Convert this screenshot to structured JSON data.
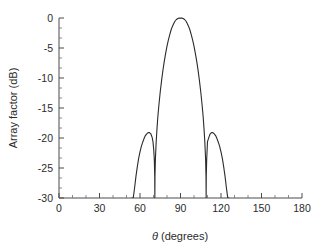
{
  "chart_data": {
    "type": "line",
    "title": "",
    "subtitle": "",
    "xlabel": "θ (degrees)",
    "ylabel": "Array factor (dB)",
    "xlim": [
      0,
      180
    ],
    "ylim": [
      -30,
      0
    ],
    "xticks": [
      0,
      30,
      60,
      90,
      120,
      150,
      180
    ],
    "xticklabels": [
      "0",
      "30",
      "60",
      "90",
      "120",
      "150",
      "180"
    ],
    "yticks": [
      0,
      -5,
      -10,
      -15,
      -20,
      -25,
      -30
    ],
    "yticklabels": [
      "0",
      "-5",
      "-10",
      "-15",
      "-20",
      "-25",
      "-30"
    ],
    "minor_ticks_per_interval": 2,
    "grid": false,
    "legend": null,
    "annotations": [],
    "line_color": "#2b2b2b",
    "axis_color": "#4a4a4a",
    "background_color": "#ffffff",
    "series": [
      {
        "name": "Array factor",
        "x": [
          54.0,
          55.0,
          56.0,
          57.0,
          58.0,
          59.0,
          60.0,
          61.0,
          62.0,
          63.0,
          64.0,
          65.0,
          66.0,
          67.0,
          68.0,
          69.0,
          69.6,
          70.2,
          70.6,
          70.9,
          71.0,
          71.1,
          71.4,
          72.0,
          72.6,
          73.2,
          74.0,
          75.0,
          76.0,
          77.0,
          78.0,
          79.0,
          80.0,
          81.0,
          82.0,
          83.0,
          84.0,
          85.0,
          86.0,
          87.0,
          88.0,
          89.0,
          90.0,
          91.0,
          92.0,
          93.0,
          94.0,
          95.0,
          96.0,
          97.0,
          98.0,
          99.0,
          100.0,
          101.0,
          102.0,
          103.0,
          104.0,
          105.0,
          106.0,
          106.8,
          107.4,
          108.0,
          108.6,
          108.9,
          109.0,
          109.1,
          109.4,
          110.0,
          111.0,
          112.0,
          113.0,
          114.0,
          115.0,
          116.0,
          117.0,
          118.0,
          119.0,
          120.0,
          121.0,
          122.0,
          123.0,
          124.0,
          125.0,
          126.0
        ],
        "y": [
          -30.0,
          -30.0,
          -28.3,
          -26.4,
          -24.8,
          -23.4,
          -22.3,
          -21.4,
          -20.7,
          -20.1,
          -19.6,
          -19.3,
          -19.1,
          -19.1,
          -19.3,
          -19.9,
          -20.6,
          -22.0,
          -23.6,
          -26.5,
          -30.0,
          -26.5,
          -23.6,
          -20.6,
          -18.4,
          -16.5,
          -14.5,
          -12.3,
          -10.4,
          -8.7,
          -7.2,
          -5.9,
          -4.7,
          -3.7,
          -2.8,
          -2.0,
          -1.4,
          -0.9,
          -0.5,
          -0.25,
          -0.08,
          -0.02,
          0.0,
          -0.02,
          -0.08,
          -0.25,
          -0.5,
          -0.9,
          -1.4,
          -2.0,
          -2.8,
          -3.7,
          -4.7,
          -5.9,
          -7.2,
          -8.7,
          -10.4,
          -12.3,
          -14.5,
          -16.5,
          -18.4,
          -20.6,
          -23.6,
          -26.5,
          -30.0,
          -26.5,
          -23.6,
          -20.6,
          -19.9,
          -19.3,
          -19.1,
          -19.1,
          -19.3,
          -19.6,
          -20.1,
          -20.7,
          -21.4,
          -22.3,
          -23.4,
          -24.8,
          -26.4,
          -28.3,
          -30.0,
          -30.0
        ]
      }
    ],
    "features": {
      "main_lobe_peak_deg": 90,
      "main_lobe_peak_db": 0,
      "side_lobe_peaks_deg": [
        66,
        114
      ],
      "side_lobe_peak_db": -19,
      "null_positions_deg": [
        71,
        109
      ],
      "lower_crossing_deg": 55,
      "upper_crossing_deg": 125
    }
  }
}
